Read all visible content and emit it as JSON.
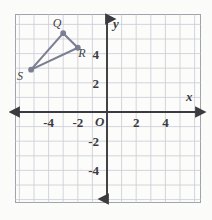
{
  "figure": {
    "background_color": "#fbfbfa",
    "grid_color": "#c9ccd4",
    "border_color": "#9fa3ab",
    "axis_color": "#3b3b3f",
    "shape_color": "#7b7f93"
  },
  "axes": {
    "x_axis_label": "x",
    "y_axis_label": "y",
    "origin_label": "O",
    "x_ticks": [
      "-4",
      "-2",
      "2",
      "4"
    ],
    "x_tick_values": [
      -4,
      -2,
      2,
      4
    ],
    "y_ticks": [
      "4",
      "2",
      "-2",
      "-4"
    ],
    "y_tick_values": [
      4,
      2,
      -2,
      -4
    ],
    "x_range": [
      -6,
      6.4
    ],
    "y_range": [
      -6,
      6.4
    ],
    "grid_spacing": 1,
    "grid": true
  },
  "chart_data": {
    "type": "scatter",
    "xlabel": "x",
    "ylabel": "y",
    "xlim": [
      -6,
      6.4
    ],
    "ylim": [
      -6,
      6.4
    ],
    "grid": true,
    "shape": "triangle",
    "points": [
      {
        "name": "Q",
        "x": -3,
        "y": 5.4,
        "label": "Q",
        "label_dx": -6,
        "label_dy": -6
      },
      {
        "name": "R",
        "x": -2,
        "y": 4.4,
        "label": "R",
        "label_dx": 4,
        "label_dy": 9
      },
      {
        "name": "S",
        "x": -5.2,
        "y": 2.9,
        "label": "S",
        "label_dx": -11,
        "label_dy": 10
      }
    ],
    "edges": [
      {
        "from": "Q",
        "to": "R"
      },
      {
        "from": "R",
        "to": "S"
      },
      {
        "from": "S",
        "to": "Q"
      }
    ]
  }
}
